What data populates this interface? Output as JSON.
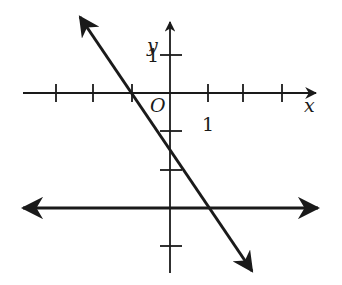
{
  "diagram": {
    "type": "coordinate-plane",
    "axes": {
      "x_label": "x",
      "y_label": "y",
      "origin_label": "O",
      "x_tick_label": "1",
      "y_tick_label": "1",
      "x_ticks": [
        -4,
        -3,
        -2,
        -1,
        1,
        2,
        3
      ],
      "y_ticks": [
        1,
        -1,
        -2,
        -3,
        -4
      ]
    },
    "lines": [
      {
        "name": "sloped-line",
        "equation": "y = -3/2 x - 3/2",
        "slope": -1.5,
        "y_intercept": -1.5,
        "x_intercept": -1,
        "arrows": "both"
      },
      {
        "name": "horizontal-line",
        "equation": "y = -3",
        "slope": 0,
        "y_intercept": -3,
        "arrows": "both"
      }
    ],
    "intersection": {
      "x": 1,
      "y": -3
    },
    "colors": {
      "ink": "#1a1a1a",
      "background": "#ffffff"
    }
  }
}
